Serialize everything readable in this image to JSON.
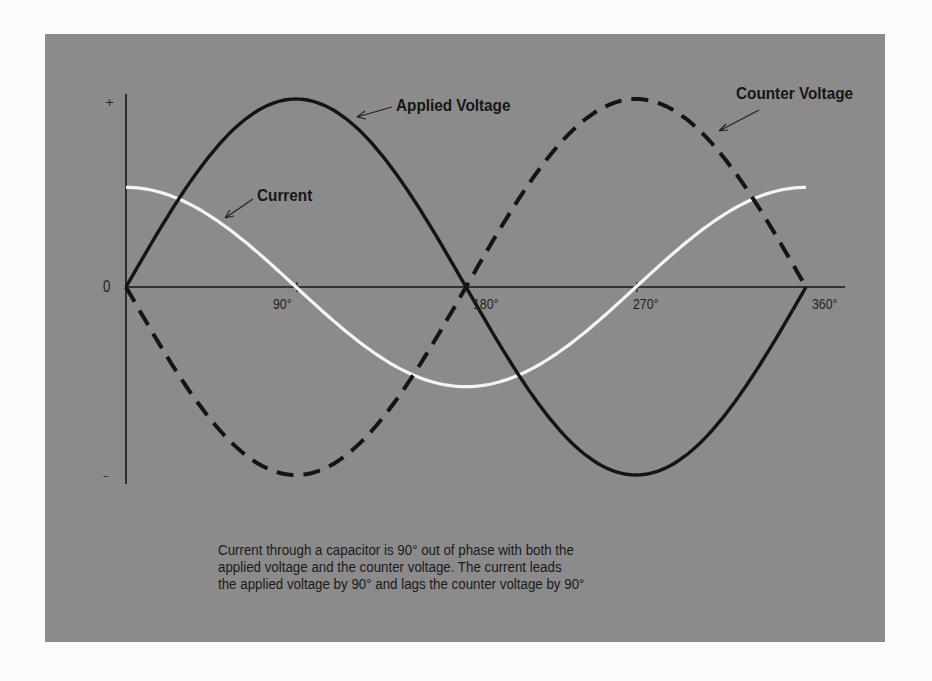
{
  "chart_data": {
    "type": "line",
    "title": "",
    "xlabel": "",
    "ylabel": "",
    "x_ticks": [
      "0",
      "90°",
      "180°",
      "270°",
      "360°"
    ],
    "y_ticks": [
      "+",
      "0",
      "–"
    ],
    "x": [
      0,
      30,
      60,
      90,
      120,
      150,
      180,
      210,
      240,
      270,
      300,
      330,
      360
    ],
    "series": [
      {
        "name": "Applied Voltage",
        "style": "solid-black",
        "values": [
          0,
          0.5,
          0.866,
          1,
          0.866,
          0.5,
          0,
          -0.5,
          -0.866,
          -1,
          -0.866,
          -0.5,
          0
        ]
      },
      {
        "name": "Counter Voltage",
        "style": "dashed-black",
        "values": [
          0,
          -0.5,
          -0.866,
          -1,
          -0.866,
          -0.5,
          0,
          0.5,
          0.866,
          1,
          0.866,
          0.5,
          0
        ]
      },
      {
        "name": "Current",
        "style": "solid-white",
        "values": [
          0.53,
          0.46,
          0.265,
          0,
          -0.265,
          -0.46,
          -0.53,
          -0.46,
          -0.265,
          0,
          0.265,
          0.46,
          0.53
        ]
      }
    ],
    "ylim": [
      -1,
      1
    ],
    "xlim": [
      0,
      360
    ],
    "grid": false,
    "legend": "inline annotations with arrows"
  },
  "labels": {
    "applied_voltage": "Applied Voltage",
    "counter_voltage": "Counter Voltage",
    "current": "Current",
    "plus": "+",
    "minus": "–",
    "zero": "0",
    "tick_90": "90°",
    "tick_180": "180°",
    "tick_270": "270°",
    "tick_360": "360°"
  },
  "caption": {
    "line1": "Current through a capacitor is 90° out of phase with both the",
    "line2": "applied voltage and the counter voltage.  The current leads",
    "line3": "the applied voltage by 90° and lags the counter voltage by 90°"
  },
  "colors": {
    "panel": "#8b8b8b",
    "background": "#fbfbfb",
    "voltage": "#141414",
    "current": "#f4f4f4"
  }
}
